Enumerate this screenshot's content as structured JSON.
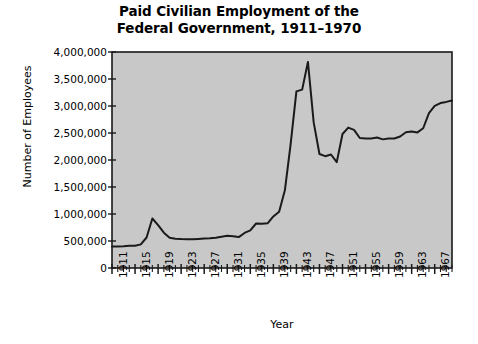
{
  "chart_data": {
    "type": "line",
    "title": "Paid Civilian Employment of the\nFederal Government, 1911–1970",
    "xlabel": "Year",
    "ylabel": "Number of Employees",
    "xlim": [
      1911,
      1970
    ],
    "ylim": [
      0,
      4000000
    ],
    "grid": false,
    "legend": null,
    "plot_background": "#c8c8c8",
    "line_color": "#1a1a1a",
    "figure_background": "#ffffff",
    "ytick_labels": [
      "0",
      "500,000",
      "1,000,000",
      "1,500,000",
      "2,000,000",
      "2,500,000",
      "3,000,000",
      "3,500,000",
      "4,000,000"
    ],
    "ytick_values": [
      0,
      500000,
      1000000,
      1500000,
      2000000,
      2500000,
      3000000,
      3500000,
      4000000
    ],
    "xtick_labels": [
      "1911",
      "1915",
      "1919",
      "1923",
      "1927",
      "1931",
      "1935",
      "1939",
      "1943",
      "1947",
      "1951",
      "1955",
      "1959",
      "1963",
      "1967"
    ],
    "xtick_values": [
      1911,
      1915,
      1919,
      1923,
      1927,
      1931,
      1935,
      1939,
      1943,
      1947,
      1951,
      1955,
      1959,
      1963,
      1967
    ],
    "x": [
      1911,
      1912,
      1913,
      1914,
      1915,
      1916,
      1917,
      1918,
      1919,
      1920,
      1921,
      1922,
      1923,
      1924,
      1925,
      1926,
      1927,
      1928,
      1929,
      1930,
      1931,
      1932,
      1933,
      1934,
      1935,
      1936,
      1937,
      1938,
      1939,
      1940,
      1941,
      1942,
      1943,
      1944,
      1945,
      1946,
      1947,
      1948,
      1949,
      1950,
      1951,
      1952,
      1953,
      1954,
      1955,
      1956,
      1957,
      1958,
      1959,
      1960,
      1961,
      1962,
      1963,
      1964,
      1965,
      1966,
      1967,
      1968,
      1969,
      1970
    ],
    "values": [
      396000,
      400000,
      403000,
      410000,
      412000,
      438000,
      565000,
      917000,
      794000,
      655000,
      561000,
      543000,
      536000,
      533000,
      533000,
      539000,
      547000,
      552000,
      560000,
      580000,
      596000,
      589000,
      572000,
      649000,
      698000,
      824000,
      820000,
      827000,
      954000,
      1042000,
      1438000,
      2296000,
      3270000,
      3304000,
      3816000,
      2696000,
      2111000,
      2071000,
      2102000,
      1960000,
      2482000,
      2600000,
      2558000,
      2407000,
      2397000,
      2399000,
      2417000,
      2382000,
      2399000,
      2399000,
      2435000,
      2514000,
      2528000,
      2511000,
      2588000,
      2868000,
      3002000,
      3055000,
      3076000,
      3103000
    ]
  }
}
